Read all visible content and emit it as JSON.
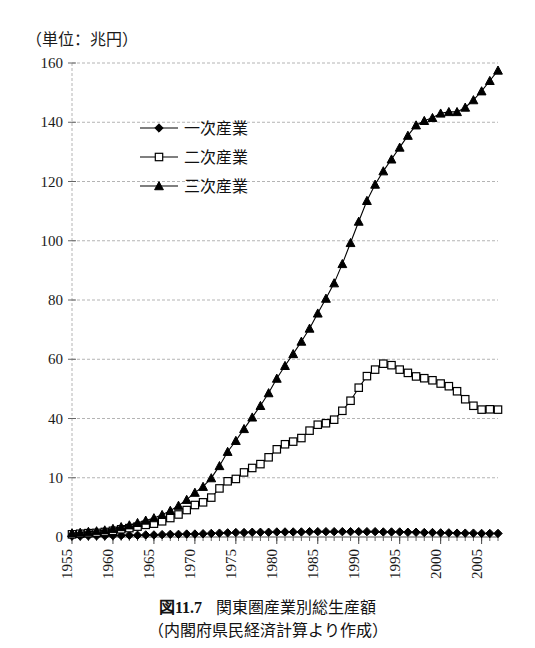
{
  "unit_label": "（単位：兆円）",
  "caption": {
    "fig_prefix": "図",
    "fig_number": "11.7",
    "title": "関東圏産業別総生産額",
    "source": "（内閣府県民経済計算より作成）"
  },
  "legend": {
    "position": "inside-upper-left",
    "items": [
      {
        "label": "一次産業",
        "marker": "diamond",
        "fill": "#000000"
      },
      {
        "label": "二次産業",
        "marker": "square",
        "fill": "#ffffff"
      },
      {
        "label": "三次産業",
        "marker": "triangle",
        "fill": "#000000"
      }
    ]
  },
  "colors": {
    "line": "#000000",
    "grid": "#b4b4b4",
    "axis": "#808080",
    "text": "#1a1a1a"
  },
  "chart_data": {
    "type": "line",
    "title": "関東圏産業別総生産額",
    "xlabel": "",
    "ylabel": "兆円",
    "ylim": [
      0,
      160
    ],
    "xlim": [
      1955,
      2007
    ],
    "grid": true,
    "ytick_labels": [
      "160",
      "140",
      "120",
      "100",
      "80",
      "60",
      "40",
      "10",
      "0"
    ],
    "ytick_values": [
      160,
      140,
      120,
      100,
      80,
      60,
      40,
      20,
      0
    ],
    "xtick_labels": [
      "1955",
      "1960",
      "1965",
      "1970",
      "1975",
      "1980",
      "1985",
      "1990",
      "1995",
      "2000",
      "2005"
    ],
    "xtick_values": [
      1955,
      1960,
      1965,
      1970,
      1975,
      1980,
      1985,
      1990,
      1995,
      2000,
      2005
    ],
    "x": [
      1955,
      1956,
      1957,
      1958,
      1959,
      1960,
      1961,
      1962,
      1963,
      1964,
      1965,
      1966,
      1967,
      1968,
      1969,
      1970,
      1971,
      1972,
      1973,
      1974,
      1975,
      1976,
      1977,
      1978,
      1979,
      1980,
      1981,
      1982,
      1983,
      1984,
      1985,
      1986,
      1987,
      1988,
      1989,
      1990,
      1991,
      1992,
      1993,
      1994,
      1995,
      1996,
      1997,
      1998,
      1999,
      2000,
      2001,
      2002,
      2003,
      2004,
      2005,
      2006,
      2007
    ],
    "series": [
      {
        "name": "一次産業",
        "marker": "diamond",
        "values": [
          0.3,
          0.3,
          0.4,
          0.4,
          0.4,
          0.5,
          0.5,
          0.6,
          0.6,
          0.7,
          0.7,
          0.8,
          0.9,
          0.9,
          1.0,
          1.0,
          1.1,
          1.2,
          1.3,
          1.4,
          1.5,
          1.5,
          1.6,
          1.6,
          1.6,
          1.7,
          1.7,
          1.7,
          1.7,
          1.8,
          1.8,
          1.8,
          1.8,
          1.8,
          1.8,
          1.8,
          1.8,
          1.8,
          1.7,
          1.7,
          1.7,
          1.6,
          1.6,
          1.5,
          1.5,
          1.4,
          1.4,
          1.3,
          1.3,
          1.3,
          1.2,
          1.2,
          1.2
        ]
      },
      {
        "name": "二次産業",
        "marker": "square",
        "values": [
          0.9,
          1.1,
          1.3,
          1.4,
          1.7,
          2.1,
          2.6,
          3.0,
          3.5,
          4.1,
          4.5,
          5.3,
          6.4,
          7.6,
          9.1,
          10.8,
          11.7,
          13.3,
          16.4,
          18.8,
          19.6,
          21.8,
          23.3,
          24.6,
          26.9,
          29.6,
          31.3,
          32.2,
          33.4,
          35.9,
          37.9,
          38.4,
          39.6,
          42.6,
          46.0,
          50.4,
          54.3,
          56.5,
          58.5,
          58.0,
          56.5,
          55.4,
          54.2,
          53.6,
          52.9,
          51.8,
          50.9,
          49.2,
          46.5,
          44.3,
          43.0,
          43.1,
          43.0
        ]
      },
      {
        "name": "三次産業",
        "marker": "triangle",
        "values": [
          1.3,
          1.5,
          1.8,
          2.0,
          2.3,
          2.8,
          3.4,
          4.0,
          4.8,
          5.6,
          6.4,
          7.5,
          8.9,
          10.6,
          12.6,
          15.0,
          17.0,
          19.9,
          24.0,
          28.8,
          32.5,
          36.5,
          40.4,
          44.3,
          48.6,
          53.5,
          57.8,
          61.8,
          66.0,
          70.4,
          75.5,
          80.5,
          85.7,
          92.2,
          99.3,
          106.5,
          113.5,
          119.0,
          123.5,
          127.5,
          131.5,
          135.5,
          139.0,
          140.5,
          141.5,
          143.0,
          143.5,
          143.5,
          145.0,
          147.5,
          150.5,
          154.0,
          157.5
        ]
      }
    ]
  }
}
